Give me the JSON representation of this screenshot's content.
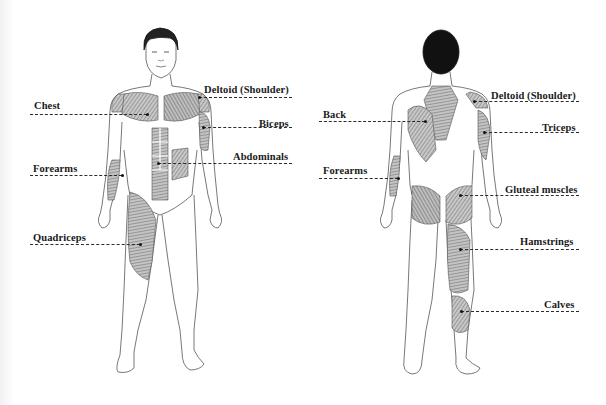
{
  "diagram": {
    "front_view": {
      "labels": [
        {
          "id": "chest",
          "text": "Chest"
        },
        {
          "id": "deltoid",
          "text": "Deltoid (Shoulder)"
        },
        {
          "id": "biceps",
          "text": "Biceps"
        },
        {
          "id": "abdominals",
          "text": "Abdominals"
        },
        {
          "id": "forearms",
          "text": "Forearms"
        },
        {
          "id": "quadriceps",
          "text": "Quadriceps"
        }
      ]
    },
    "back_view": {
      "labels": [
        {
          "id": "back",
          "text": "Back"
        },
        {
          "id": "deltoid",
          "text": "Deltoid (Shoulder)"
        },
        {
          "id": "triceps",
          "text": "Triceps"
        },
        {
          "id": "forearms",
          "text": "Forearms"
        },
        {
          "id": "gluteal",
          "text": "Gluteal muscles"
        },
        {
          "id": "hamstrings",
          "text": "Hamstrings"
        },
        {
          "id": "calves",
          "text": "Calves"
        }
      ]
    },
    "colors": {
      "outline": "#555555",
      "muscle_fill": "#9a9a9a",
      "hair": "#111111",
      "label_text": "#1a1a1a",
      "background": "#ffffff"
    }
  }
}
